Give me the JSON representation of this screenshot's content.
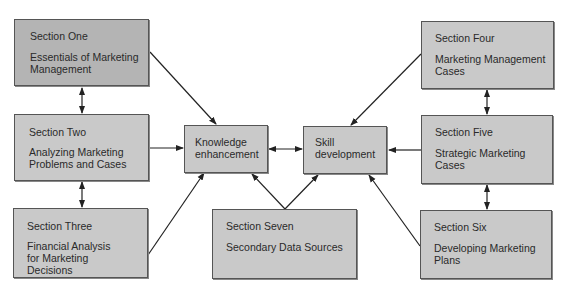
{
  "diagram": {
    "sections": [
      {
        "id": "one",
        "title": "Section One",
        "desc": "Essentials of Marketing\nManagement"
      },
      {
        "id": "two",
        "title": "Section Two",
        "desc": "Analyzing Marketing\nProblems and Cases"
      },
      {
        "id": "three",
        "title": "Section Three",
        "desc": "Financial Analysis\nfor Marketing\nDecisions"
      },
      {
        "id": "four",
        "title": "Section Four",
        "desc": "Marketing Management\nCases"
      },
      {
        "id": "five",
        "title": "Section Five",
        "desc": "Strategic Marketing\nCases"
      },
      {
        "id": "six",
        "title": "Section Six",
        "desc": "Developing Marketing\nPlans"
      },
      {
        "id": "seven",
        "title": "Section Seven",
        "desc": "Secondary Data Sources"
      }
    ],
    "hubs": {
      "knowledge": "Knowledge\nenhancement",
      "skill": "Skill\ndevelopment"
    },
    "colors": {
      "box_fill": "#c9c9c9",
      "box_fill_dark": "#b4b4b4",
      "border": "#555555",
      "line": "#2a2a2a"
    }
  }
}
